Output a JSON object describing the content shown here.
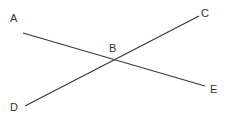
{
  "diagram": {
    "type": "intersecting-lines",
    "line_color": "#3a3a3a",
    "label_color": "#333333",
    "points": {
      "A": {
        "label": "A",
        "x": 23,
        "y": 33
      },
      "B": {
        "label": "B",
        "x": 116,
        "y": 60
      },
      "C": {
        "label": "C",
        "x": 199,
        "y": 16
      },
      "D": {
        "label": "D",
        "x": 25,
        "y": 106
      },
      "E": {
        "label": "E",
        "x": 205,
        "y": 86
      }
    },
    "segments": [
      {
        "name": "AE",
        "from": "A",
        "to": "E",
        "through": "B"
      },
      {
        "name": "DC",
        "from": "D",
        "to": "C",
        "through": "B"
      }
    ]
  }
}
